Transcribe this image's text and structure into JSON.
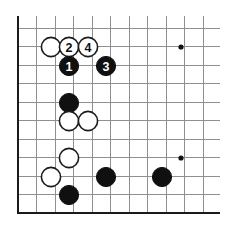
{
  "diagram": {
    "board": {
      "type": "go-board-corner",
      "line_spacing": 18.5,
      "origin_x": 18,
      "origin_y": 28,
      "columns": 11,
      "rows": 11,
      "edges_shown": [
        "left",
        "bottom"
      ],
      "grid_color": "#8f8f8f",
      "edge_color": "#1a1a1a",
      "background_color": "#ffffff"
    },
    "star_points": [
      {
        "name": "star-point-upper-right",
        "col": 9,
        "row": 1,
        "x": 181,
        "y": 47
      },
      {
        "name": "star-point-lower-right",
        "col": 9,
        "row": 7,
        "x": 181,
        "y": 158
      }
    ],
    "stones": [
      {
        "id": "white-corner-stone",
        "color": "white",
        "label": "",
        "col": 2,
        "row": 1,
        "x": 51,
        "y": 47
      },
      {
        "id": "white-move-2",
        "color": "white",
        "label": "2",
        "col": 3,
        "row": 1,
        "x": 69,
        "y": 47
      },
      {
        "id": "white-move-4",
        "color": "white",
        "label": "4",
        "col": 4,
        "row": 1,
        "x": 88,
        "y": 47
      },
      {
        "id": "black-move-1",
        "color": "black",
        "label": "1",
        "col": 3,
        "row": 2,
        "x": 69,
        "y": 66
      },
      {
        "id": "black-move-3",
        "color": "black",
        "label": "3",
        "col": 5,
        "row": 2,
        "x": 106,
        "y": 66
      },
      {
        "id": "black-stone-upper-left",
        "color": "black",
        "label": "",
        "col": 3,
        "row": 4,
        "x": 69,
        "y": 103
      },
      {
        "id": "white-stone-mid-a",
        "color": "white",
        "label": "",
        "col": 3,
        "row": 5,
        "x": 69,
        "y": 121
      },
      {
        "id": "white-stone-mid-b",
        "color": "white",
        "label": "",
        "col": 4,
        "row": 5,
        "x": 88,
        "y": 121
      },
      {
        "id": "white-stone-lower-a",
        "color": "white",
        "label": "",
        "col": 3,
        "row": 7,
        "x": 69,
        "y": 158
      },
      {
        "id": "white-stone-lower-b",
        "color": "white",
        "label": "",
        "col": 2,
        "row": 8,
        "x": 51,
        "y": 177
      },
      {
        "id": "black-stone-bottom-left",
        "color": "black",
        "label": "",
        "col": 3,
        "row": 9,
        "x": 69,
        "y": 195
      },
      {
        "id": "black-stone-bottom-mid",
        "color": "black",
        "label": "",
        "col": 5,
        "row": 8,
        "x": 106,
        "y": 177
      },
      {
        "id": "black-stone-bottom-rt",
        "color": "black",
        "label": "",
        "col": 8,
        "row": 8,
        "x": 162,
        "y": 177
      }
    ],
    "move_sequence": [
      {
        "number": "1",
        "color": "black"
      },
      {
        "number": "2",
        "color": "white"
      },
      {
        "number": "3",
        "color": "black"
      },
      {
        "number": "4",
        "color": "white"
      }
    ]
  }
}
